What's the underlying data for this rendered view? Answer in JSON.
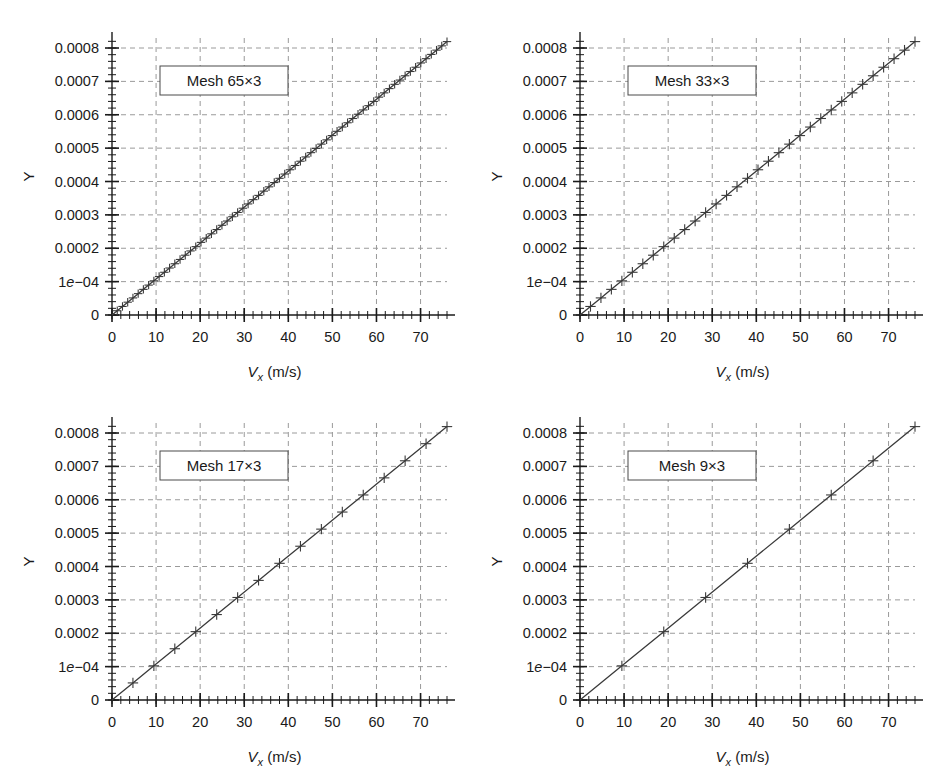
{
  "figure": {
    "background_color": "#ffffff",
    "line_color": "#3a3a3a",
    "grid_color": "#9a9a9a",
    "axis_color": "#1a1a1a",
    "panel_count": 4
  },
  "axis": {
    "xlabel_var": "V",
    "xlabel_sub": "x",
    "xlabel_unit": " (m/s)",
    "xlabel_full": "Vx (m/s)",
    "ylabel": "Y",
    "xticks": [
      0,
      10,
      20,
      30,
      40,
      50,
      60,
      70
    ],
    "xtick_labels": [
      "0",
      "10",
      "20",
      "30",
      "40",
      "50",
      "60",
      "70"
    ],
    "xminor_step": 2,
    "xlim": [
      0,
      76
    ],
    "yticks": [
      0,
      0.0001,
      0.0002,
      0.0003,
      0.0004,
      0.0005,
      0.0006,
      0.0007,
      0.0008
    ],
    "ytick_labels": [
      "0",
      "1e-04",
      "0.0002",
      "0.0003",
      "0.0004",
      "0.0005",
      "0.0006",
      "0.0007",
      "0.0008"
    ],
    "ylim": [
      0,
      0.00083
    ],
    "yminor_step": 2e-05,
    "grid": true,
    "grid_style": "dashed"
  },
  "chart_data": [
    {
      "type": "scatter",
      "id": "mesh-65x3",
      "title": "Mesh 65×3",
      "legend_label": "Mesh 65×3",
      "xlabel": "Vx (m/s)",
      "ylabel": "Y",
      "xlim": [
        0,
        76
      ],
      "ylim": [
        0,
        0.00083
      ],
      "grid": true,
      "marker": "plus",
      "n_points": 64,
      "x": [
        1.19,
        2.38,
        3.56,
        4.75,
        5.94,
        7.12,
        8.31,
        9.5,
        10.69,
        11.88,
        13.06,
        14.25,
        15.44,
        16.62,
        17.81,
        19.0,
        20.19,
        21.38,
        22.56,
        23.75,
        24.94,
        26.12,
        27.31,
        28.5,
        29.69,
        30.88,
        32.06,
        33.25,
        34.44,
        35.62,
        36.81,
        38.0,
        39.19,
        40.38,
        41.56,
        42.75,
        43.94,
        45.12,
        46.31,
        47.5,
        48.69,
        49.88,
        51.06,
        52.25,
        53.44,
        54.62,
        55.81,
        57.0,
        58.19,
        59.38,
        60.56,
        61.75,
        62.94,
        64.12,
        65.31,
        66.5,
        67.69,
        68.88,
        70.06,
        71.25,
        72.44,
        73.62,
        74.81,
        76.0
      ],
      "y": [
        1.28e-05,
        2.56e-05,
        3.84e-05,
        5.12e-05,
        6.4e-05,
        7.68e-05,
        8.96e-05,
        0.0001024,
        0.0001152,
        0.000128,
        0.0001408,
        0.0001536,
        0.0001664,
        0.0001792,
        0.000192,
        0.0002048,
        0.0002176,
        0.0002304,
        0.0002432,
        0.000256,
        0.0002688,
        0.0002816,
        0.0002944,
        0.0003072,
        0.00032,
        0.0003328,
        0.0003456,
        0.0003584,
        0.0003712,
        0.000384,
        0.0003968,
        0.0004096,
        0.0004224,
        0.0004352,
        0.000448,
        0.0004608,
        0.0004736,
        0.0004864,
        0.0004992,
        0.000512,
        0.0005248,
        0.0005376,
        0.0005504,
        0.0005632,
        0.000576,
        0.0005888,
        0.0006016,
        0.0006144,
        0.0006272,
        0.00064,
        0.0006528,
        0.0006656,
        0.0006784,
        0.0006912,
        0.000704,
        0.0007168,
        0.0007296,
        0.0007424,
        0.0007552,
        0.000768,
        0.0007808,
        0.0007936,
        0.0008064,
        0.0008192
      ]
    },
    {
      "type": "scatter",
      "id": "mesh-33x3",
      "title": "Mesh 33×3",
      "legend_label": "Mesh 33×3",
      "xlabel": "Vx (m/s)",
      "ylabel": "Y",
      "xlim": [
        0,
        76
      ],
      "ylim": [
        0,
        0.00083
      ],
      "grid": true,
      "marker": "plus",
      "n_points": 32,
      "x": [
        2.38,
        4.75,
        7.12,
        9.5,
        11.88,
        14.25,
        16.62,
        19.0,
        21.38,
        23.75,
        26.12,
        28.5,
        30.88,
        33.25,
        35.62,
        38.0,
        40.38,
        42.75,
        45.12,
        47.5,
        49.88,
        52.25,
        54.62,
        57.0,
        59.38,
        61.75,
        64.12,
        66.5,
        68.88,
        71.25,
        73.62,
        76.0
      ],
      "y": [
        2.56e-05,
        5.12e-05,
        7.68e-05,
        0.0001024,
        0.000128,
        0.0001536,
        0.0001792,
        0.0002048,
        0.0002304,
        0.000256,
        0.0002816,
        0.0003072,
        0.0003328,
        0.0003584,
        0.000384,
        0.0004096,
        0.0004352,
        0.0004608,
        0.0004864,
        0.000512,
        0.0005376,
        0.0005632,
        0.0005888,
        0.0006144,
        0.00064,
        0.0006656,
        0.0006912,
        0.0007168,
        0.0007424,
        0.000768,
        0.0007936,
        0.0008192
      ]
    },
    {
      "type": "scatter",
      "id": "mesh-17x3",
      "title": "Mesh 17×3",
      "legend_label": "Mesh 17×3",
      "xlabel": "Vx (m/s)",
      "ylabel": "Y",
      "xlim": [
        0,
        76
      ],
      "ylim": [
        0,
        0.00083
      ],
      "grid": true,
      "marker": "plus",
      "n_points": 16,
      "x": [
        4.75,
        9.5,
        14.25,
        19.0,
        23.75,
        28.5,
        33.25,
        38.0,
        42.75,
        47.5,
        52.25,
        57.0,
        61.75,
        66.5,
        71.25,
        76.0
      ],
      "y": [
        5.12e-05,
        0.0001024,
        0.0001536,
        0.0002048,
        0.000256,
        0.0003072,
        0.0003584,
        0.0004096,
        0.0004608,
        0.000512,
        0.0005632,
        0.0006144,
        0.0006656,
        0.0007168,
        0.000768,
        0.0008192
      ]
    },
    {
      "type": "scatter",
      "id": "mesh-9x3",
      "title": "Mesh 9×3",
      "legend_label": "Mesh 9×3",
      "xlabel": "Vx (m/s)",
      "ylabel": "Y",
      "xlim": [
        0,
        76
      ],
      "ylim": [
        0,
        0.00083
      ],
      "grid": true,
      "marker": "plus",
      "n_points": 8,
      "x": [
        9.5,
        19.0,
        28.5,
        38.0,
        47.5,
        57.0,
        66.5,
        76.0
      ],
      "y": [
        0.0001024,
        0.0002048,
        0.0003072,
        0.0004096,
        0.000512,
        0.0006144,
        0.0007168,
        0.0008192
      ]
    }
  ]
}
